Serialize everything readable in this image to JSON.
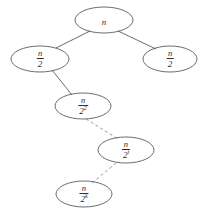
{
  "diagram": {
    "type": "tree",
    "background_color": "#ffffff",
    "stroke_color": "#5a5a66",
    "dashed_stroke_color": "#8c8c96",
    "text_color": "#2b2b33",
    "nodes": [
      {
        "id": "root",
        "label": "n",
        "numerator": "n",
        "denominator": "",
        "exponent": "",
        "is_fraction": false,
        "cx": 104,
        "cy": 20,
        "rx": 29,
        "ry": 13
      },
      {
        "id": "left-1",
        "label": "n/2",
        "numerator": "n",
        "denominator": "2",
        "exponent": "",
        "is_fraction": true,
        "cx": 40,
        "cy": 59,
        "rx": 29,
        "ry": 13
      },
      {
        "id": "right-1",
        "label": "n/2",
        "numerator": "n",
        "denominator": "2",
        "exponent": "",
        "is_fraction": true,
        "cx": 170,
        "cy": 59,
        "rx": 27,
        "ry": 13
      },
      {
        "id": "left-2",
        "label": "n/2^2",
        "numerator": "n",
        "denominator": "2",
        "exponent": "2",
        "is_fraction": true,
        "cx": 83,
        "cy": 106,
        "rx": 28,
        "ry": 13
      },
      {
        "id": "level-i",
        "label": "n/2^i",
        "numerator": "n",
        "denominator": "2",
        "exponent": "i",
        "is_fraction": true,
        "cx": 126,
        "cy": 150,
        "rx": 28,
        "ry": 13
      },
      {
        "id": "level-k",
        "label": "n/2^k",
        "numerator": "n",
        "denominator": "2",
        "exponent": "k",
        "is_fraction": true,
        "cx": 84,
        "cy": 194,
        "rx": 28,
        "ry": 13
      }
    ],
    "edges": [
      {
        "id": "root-to-left-1",
        "from": "root",
        "to": "left-1",
        "style": "solid",
        "x1": 90,
        "y1": 31,
        "x2": 56,
        "y2": 48
      },
      {
        "id": "root-to-right-1",
        "from": "root",
        "to": "right-1",
        "style": "solid",
        "x1": 118,
        "y1": 31,
        "x2": 156,
        "y2": 49
      },
      {
        "id": "left-1-to-left-2",
        "from": "left-1",
        "to": "left-2",
        "style": "solid",
        "x1": 52,
        "y1": 70,
        "x2": 72,
        "y2": 95
      },
      {
        "id": "left-2-to-level-i",
        "from": "left-2",
        "to": "level-i",
        "style": "dashed",
        "x1": 86,
        "y1": 119,
        "x2": 118,
        "y2": 139
      },
      {
        "id": "level-i-to-level-k",
        "from": "level-i",
        "to": "level-k",
        "style": "dashed",
        "x1": 116,
        "y1": 163,
        "x2": 92,
        "y2": 183
      }
    ]
  }
}
